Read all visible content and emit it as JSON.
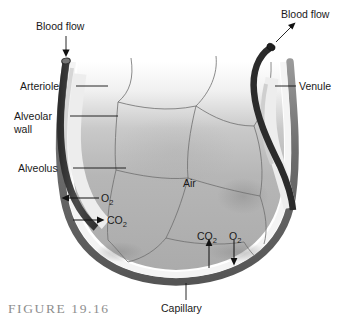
{
  "figure": {
    "caption": "FIGURE 19.16",
    "background_color": "#ffffff"
  },
  "labels": {
    "blood_flow_in": "Blood flow",
    "blood_flow_out": "Blood flow",
    "arteriole": "Arteriole",
    "alveolar_wall_line1": "Alveolar",
    "alveolar_wall_line2": "wall",
    "alveolus": "Alveolus",
    "venule": "Venule",
    "air": "Air",
    "capillary": "Capillary"
  },
  "gases": {
    "o2_symbol": "O",
    "o2_subscript": "2",
    "co2_symbol": "CO",
    "co2_subscript": "2",
    "left_oxygen": "O2",
    "left_carbon_dioxide": "CO2",
    "bottom_carbon_dioxide": "CO2",
    "bottom_oxygen": "O2"
  },
  "colors": {
    "vessel_dark": "#3f3f3f",
    "venule_dark": "#2b2b2b",
    "capillary_rim": "#6e6e6e",
    "wall_light": "#f2f2f2",
    "interior_gray": "#b4b4b4",
    "cell_line": "#6b6b6b",
    "label_text": "#1a1a1a",
    "caption_text": "#8e8e8e"
  },
  "annotations": {
    "o2_direction_left": "into blood",
    "co2_direction_left": "into alveolus",
    "co2_direction_bottom": "into alveolus",
    "o2_direction_bottom": "into blood"
  }
}
